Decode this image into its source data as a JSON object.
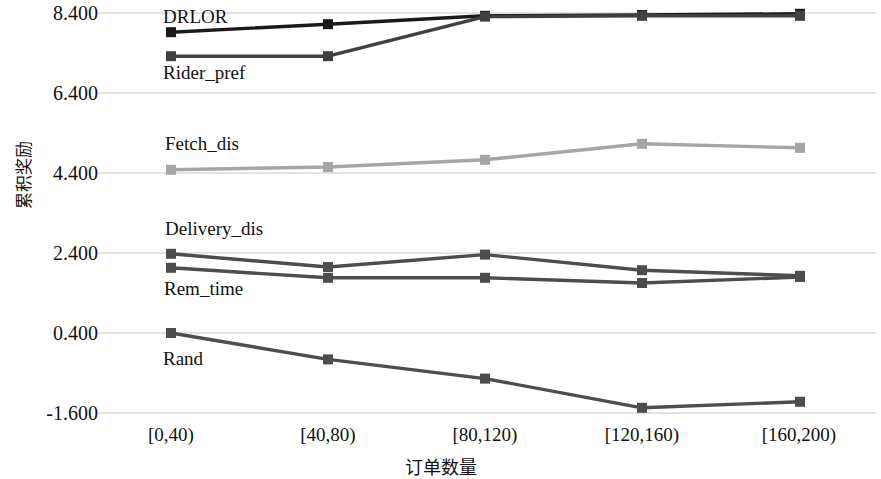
{
  "chart_data": {
    "type": "line",
    "title": "",
    "xlabel": "订单数量",
    "ylabel": "累积奖励",
    "categories": [
      "[0,40)",
      "[40,80)",
      "[80,120)",
      "[120,160)",
      "[160,200)"
    ],
    "ylim": [
      -1.6,
      8.4
    ],
    "yticks": [
      "8.400",
      "6.400",
      "4.400",
      "2.400",
      "0.400",
      "-1.600"
    ],
    "ytick_values": [
      8.4,
      6.4,
      4.4,
      2.4,
      0.4,
      -1.6
    ],
    "grid": true,
    "legend": "inline-labels",
    "markers": "square",
    "series": [
      {
        "name": "DRLOR",
        "color": "#1a1a1a",
        "label_x": 163,
        "label_y": 16,
        "values": [
          7.92,
          8.12,
          8.33,
          8.35,
          8.38
        ]
      },
      {
        "name": "Rider_pref",
        "color": "#404040",
        "label_x": 163,
        "label_y": 68,
        "values": [
          7.32,
          7.32,
          8.31,
          8.33,
          8.33
        ]
      },
      {
        "name": "Fetch_dis",
        "color": "#a6a6a6",
        "label_x": 165,
        "label_y": 140,
        "values": [
          4.48,
          4.55,
          4.73,
          5.13,
          5.03
        ]
      },
      {
        "name": "Delivery_dis",
        "color": "#4d4d4d",
        "label_x": 165,
        "label_y": 224,
        "values": [
          2.38,
          2.05,
          2.36,
          1.97,
          1.83
        ]
      },
      {
        "name": "Rem_time",
        "color": "#4d4d4d",
        "label_x": 164,
        "label_y": 283,
        "values": [
          2.03,
          1.78,
          1.78,
          1.65,
          1.8
        ]
      },
      {
        "name": "Rand",
        "color": "#4d4d4d",
        "label_x": 163,
        "label_y": 354,
        "values": [
          0.4,
          -0.26,
          -0.74,
          -1.47,
          -1.32
        ]
      }
    ]
  },
  "axis": {
    "y_title": "累积奖励",
    "x_title": "订单数量",
    "y_ticks": [
      "8.400",
      "6.400",
      "4.400",
      "2.400",
      "0.400",
      "-1.600"
    ],
    "x_ticks": [
      "[0,40)",
      "[40,80)",
      "[80,120)",
      "[120,160)",
      "[160,200)"
    ]
  },
  "series_labels": {
    "drlor": "DRLOR",
    "rider_pref": "Rider_pref",
    "fetch_dis": "Fetch_dis",
    "delivery_dis": "Delivery_dis",
    "rem_time": "Rem_time",
    "rand": "Rand"
  }
}
